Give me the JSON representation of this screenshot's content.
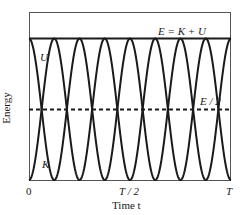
{
  "chart_data": {
    "type": "line",
    "title": "",
    "xlabel": "Time t",
    "ylabel": "Energy",
    "xlim": [
      0,
      1
    ],
    "ylim": [
      0,
      1.15
    ],
    "grid": false,
    "xticks": [
      {
        "value": 0,
        "label": "0"
      },
      {
        "value": 0.5,
        "label": "T / 2"
      },
      {
        "value": 1,
        "label": "T"
      }
    ],
    "series": [
      {
        "name": "E = K + U",
        "style": "solid",
        "formula": "E",
        "values_desc": "constant at E = 1"
      },
      {
        "name": "U",
        "style": "solid",
        "formula": "E cos^2(4*pi*t/T)",
        "values_desc": "starts at E, zero at T/8, 3T/8, 5T/8, 7T/8"
      },
      {
        "name": "K",
        "style": "solid",
        "formula": "E sin^2(4*pi*t/T)",
        "values_desc": "starts at 0, peaks at T/8, 3T/8, 5T/8, 7T/8"
      },
      {
        "name": "E / 2",
        "style": "dashed",
        "formula": "E/2",
        "values_desc": "constant at 0.5"
      }
    ],
    "annotations": [
      {
        "text": "E = K + U",
        "x": 0.72,
        "y": 1.02
      },
      {
        "text": "U",
        "x": 0.06,
        "y": 0.82
      },
      {
        "text": "K",
        "x": 0.06,
        "y": 0.2
      },
      {
        "text": "E / 2",
        "x": 0.84,
        "y": 0.55
      }
    ],
    "sample_points": {
      "t": [
        0,
        0.0625,
        0.125,
        0.1875,
        0.25,
        0.3125,
        0.375,
        0.4375,
        0.5,
        0.5625,
        0.625,
        0.6875,
        0.75,
        0.8125,
        0.875,
        0.9375,
        1
      ],
      "U": [
        1,
        0.5,
        0,
        0.5,
        1,
        0.5,
        0,
        0.5,
        1,
        0.5,
        0,
        0.5,
        1,
        0.5,
        0,
        0.5,
        1
      ],
      "K": [
        0,
        0.5,
        1,
        0.5,
        0,
        0.5,
        1,
        0.5,
        0,
        0.5,
        1,
        0.5,
        0,
        0.5,
        1,
        0.5,
        0
      ],
      "E": [
        1,
        1,
        1,
        1,
        1,
        1,
        1,
        1,
        1,
        1,
        1,
        1,
        1,
        1,
        1,
        1,
        1
      ]
    }
  },
  "labels": {
    "energy_total": "E = K + U",
    "potential": "U",
    "kinetic": "K",
    "half_energy": "E / 2",
    "x_axis": "Time t",
    "y_axis": "Energy",
    "tick_0": "0",
    "tick_half": "T / 2",
    "tick_T": "T"
  }
}
